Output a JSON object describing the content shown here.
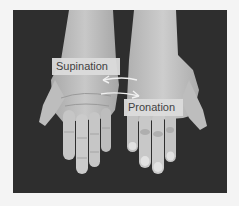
{
  "figure": {
    "labels": {
      "supination": "Supination",
      "pronation": "Pronation"
    },
    "scene": {
      "left_hand": "palm-up (supinated)",
      "right_hand": "palm-down (pronated)",
      "arrows": [
        "curved arrow pointing left (supination)",
        "curved arrow pointing right (pronation)"
      ]
    },
    "colors": {
      "background_frame": "#f4f4f4",
      "photo_background": "#2e2e2e",
      "skin_light": "#cfcfcf",
      "skin_mid": "#b8b8b8",
      "label_fill": "#dcdcdc",
      "label_text": "#3a3a3a",
      "arrow": "#f0f0f0"
    }
  }
}
